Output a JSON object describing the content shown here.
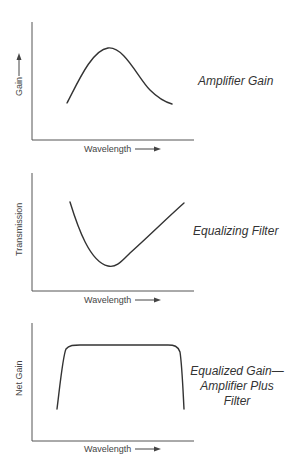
{
  "panels": [
    {
      "id": "amplifier-gain",
      "ylabel": "Gain",
      "ylabel_has_arrow": true,
      "xlabel": "Wavelength",
      "caption_lines": [
        "Amplifier Gain"
      ],
      "shape": "bell-peak"
    },
    {
      "id": "equalizing-filter",
      "ylabel": "Transmission",
      "ylabel_has_arrow": false,
      "xlabel": "Wavelength",
      "caption_lines": [
        "Equalizing Filter"
      ],
      "shape": "asymmetric-valley"
    },
    {
      "id": "equalized-gain",
      "ylabel": "Net Gain",
      "ylabel_has_arrow": false,
      "xlabel": "Wavelength",
      "caption_lines": [
        "Equalized Gain—",
        "Amplifier Plus",
        "Filter"
      ],
      "shape": "flat-top"
    }
  ],
  "colors": {
    "background": "#ffffff",
    "line": "#333333",
    "axis": "#555555",
    "text": "#333333"
  }
}
